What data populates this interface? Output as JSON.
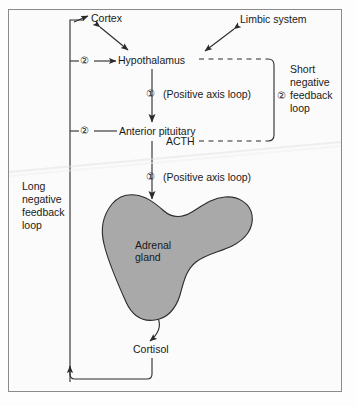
{
  "diagram": {
    "title_internal": "HPA axis feedback diagram",
    "nodes": {
      "cortex": "Cortex",
      "limbic": "Limbic system",
      "hypothalamus": "Hypothalamus",
      "anterior_pituitary": "Anterior pituitary",
      "acth": "ACTH",
      "adrenal_line1": "Adrenal",
      "adrenal_line2": "gland",
      "cortisol": "Cortisol"
    },
    "annotations": {
      "positive_axis_loop_upper": "(Positive axis loop)",
      "positive_axis_loop_lower": "(Positive axis loop)",
      "short_loop": "Short\nnegative\nfeedback\nloop",
      "long_loop": "Long\nnegative\nfeedback\nloop"
    },
    "markers": {
      "one_upper": "①",
      "one_lower": "①",
      "two_cortex": "②",
      "two_pituitary": "②",
      "two_short_loop": "②"
    },
    "colors": {
      "gland_fill": "#a9a9a9",
      "gland_stroke": "#2b2b2b",
      "line": "#2b2b2b",
      "frame_border": "#8a8a8a",
      "background": "#fbfbfb",
      "text": "#1a1a1a"
    }
  }
}
